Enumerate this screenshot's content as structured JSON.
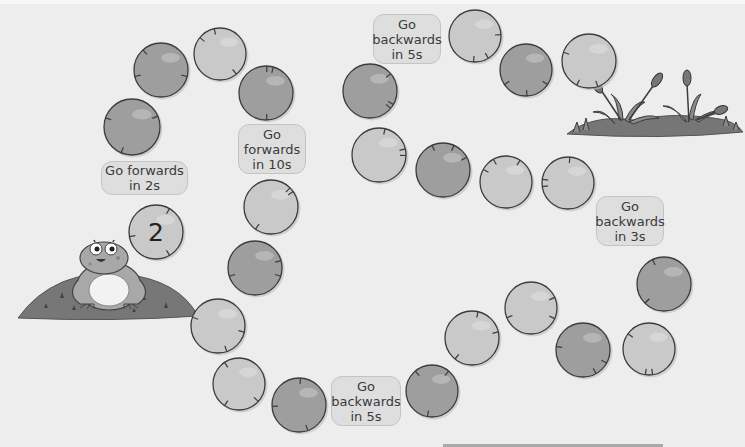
{
  "game": {
    "title": "Frog number track",
    "start_number": "2",
    "instructions": [
      {
        "id": "fwd2",
        "lines": [
          "Go forwards",
          "in 2s"
        ]
      },
      {
        "id": "fwd10",
        "lines": [
          "Go",
          "forwards",
          "in 10s"
        ]
      },
      {
        "id": "back5_top",
        "lines": [
          "Go",
          "backwards",
          "in 5s"
        ]
      },
      {
        "id": "back3",
        "lines": [
          "Go",
          "backwards",
          "in 3s"
        ]
      },
      {
        "id": "back5_bottom",
        "lines": [
          "Go",
          "backwards",
          "in 5s"
        ]
      }
    ],
    "pads": [
      {
        "index": 1,
        "x": 156,
        "y": 232,
        "r": 27,
        "shade": "light",
        "value": "2"
      },
      {
        "index": 2,
        "x": 132,
        "y": 127,
        "r": 28,
        "shade": "dark",
        "value": ""
      },
      {
        "index": 3,
        "x": 161,
        "y": 70,
        "r": 27,
        "shade": "dark",
        "value": ""
      },
      {
        "index": 4,
        "x": 220,
        "y": 54,
        "r": 26,
        "shade": "light",
        "value": ""
      },
      {
        "index": 5,
        "x": 266,
        "y": 93,
        "r": 27,
        "shade": "dark",
        "value": ""
      },
      {
        "index": 6,
        "x": 271,
        "y": 207,
        "r": 27,
        "shade": "light",
        "value": ""
      },
      {
        "index": 7,
        "x": 255,
        "y": 268,
        "r": 27,
        "shade": "dark",
        "value": ""
      },
      {
        "index": 8,
        "x": 218,
        "y": 326,
        "r": 27,
        "shade": "light",
        "value": ""
      },
      {
        "index": 9,
        "x": 239,
        "y": 384,
        "r": 26,
        "shade": "light",
        "value": ""
      },
      {
        "index": 10,
        "x": 299,
        "y": 405,
        "r": 27,
        "shade": "dark",
        "value": ""
      },
      {
        "index": 11,
        "x": 432,
        "y": 391,
        "r": 26,
        "shade": "dark",
        "value": ""
      },
      {
        "index": 12,
        "x": 472,
        "y": 338,
        "r": 27,
        "shade": "light",
        "value": ""
      },
      {
        "index": 13,
        "x": 531,
        "y": 308,
        "r": 26,
        "shade": "light",
        "value": ""
      },
      {
        "index": 14,
        "x": 583,
        "y": 350,
        "r": 27,
        "shade": "dark",
        "value": ""
      },
      {
        "index": 15,
        "x": 649,
        "y": 349,
        "r": 26,
        "shade": "light",
        "value": ""
      },
      {
        "index": 16,
        "x": 664,
        "y": 284,
        "r": 27,
        "shade": "dark",
        "value": ""
      },
      {
        "index": 17,
        "x": 568,
        "y": 183,
        "r": 26,
        "shade": "light",
        "value": ""
      },
      {
        "index": 18,
        "x": 506,
        "y": 182,
        "r": 26,
        "shade": "light",
        "value": ""
      },
      {
        "index": 19,
        "x": 443,
        "y": 170,
        "r": 27,
        "shade": "dark",
        "value": ""
      },
      {
        "index": 20,
        "x": 379,
        "y": 155,
        "r": 27,
        "shade": "light",
        "value": ""
      },
      {
        "index": 21,
        "x": 370,
        "y": 91,
        "r": 27,
        "shade": "dark",
        "value": ""
      },
      {
        "index": 22,
        "x": 475,
        "y": 36,
        "r": 26,
        "shade": "light",
        "value": ""
      },
      {
        "index": 23,
        "x": 526,
        "y": 70,
        "r": 26,
        "shade": "dark",
        "value": ""
      },
      {
        "index": 24,
        "x": 589,
        "y": 61,
        "r": 27,
        "shade": "light",
        "value": ""
      }
    ],
    "colors": {
      "background": "#ededed",
      "pad_light": "#c9c9c9",
      "pad_dark": "#9e9e9e",
      "pad_outline": "#3c3c3c",
      "label_bg": "#dedede",
      "label_border": "#c4c4c4",
      "ground": "#6f6f6f"
    }
  }
}
